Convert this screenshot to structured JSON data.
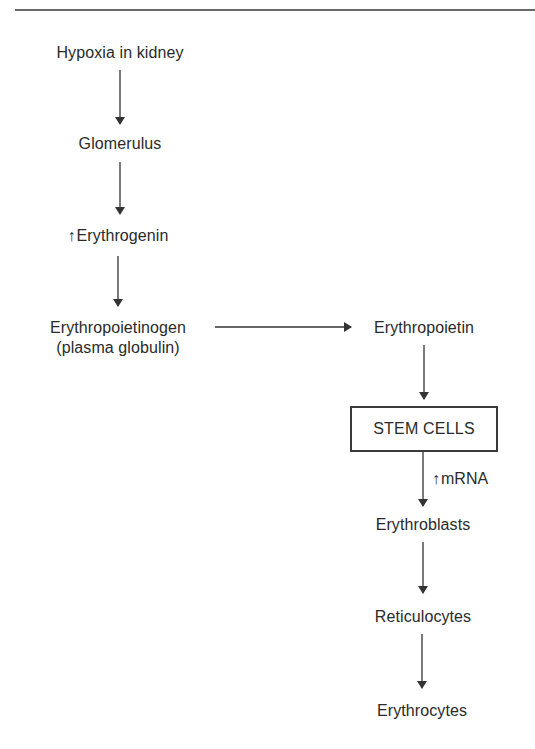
{
  "diagram": {
    "title": "",
    "colors": {
      "text": "#2a2a2a",
      "line": "#3a3a3a",
      "rule": "#6a6a6a",
      "background": "#ffffff"
    },
    "nodes": {
      "hypoxia": {
        "label": "Hypoxia in kidney"
      },
      "glomerulus": {
        "label": "Glomerulus"
      },
      "erythrogenin": {
        "prefix_icon": "↑",
        "label": "Erythrogenin"
      },
      "erythropoietinogen": {
        "label": "Erythropoietinogen",
        "sublabel": "(plasma globulin)"
      },
      "erythropoietin": {
        "label": "Erythropoietin"
      },
      "stem_cells": {
        "label": "STEM CELLS",
        "boxed": true
      },
      "erythroblasts": {
        "label": "Erythroblasts"
      },
      "reticulocytes": {
        "label": "Reticulocytes"
      },
      "erythrocytes": {
        "label": "Erythrocytes"
      }
    },
    "edge_labels": {
      "stem_to_erythroblasts": {
        "prefix_icon": "↑",
        "label": "mRNA"
      }
    },
    "edges": [
      {
        "from": "hypoxia",
        "to": "glomerulus",
        "direction": "down"
      },
      {
        "from": "glomerulus",
        "to": "erythrogenin",
        "direction": "down"
      },
      {
        "from": "erythrogenin",
        "to": "erythropoietinogen",
        "direction": "down"
      },
      {
        "from": "erythropoietinogen",
        "to": "erythropoietin",
        "direction": "right"
      },
      {
        "from": "erythropoietin",
        "to": "stem_cells",
        "direction": "down"
      },
      {
        "from": "stem_cells",
        "to": "erythroblasts",
        "direction": "down",
        "label": "↑mRNA"
      },
      {
        "from": "erythroblasts",
        "to": "reticulocytes",
        "direction": "down"
      },
      {
        "from": "reticulocytes",
        "to": "erythrocytes",
        "direction": "down"
      }
    ]
  }
}
